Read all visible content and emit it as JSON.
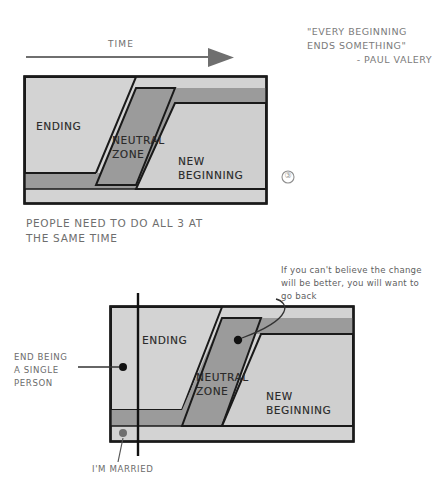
{
  "page": {
    "background": "#ffffff",
    "width": 446,
    "height": 489
  },
  "colors": {
    "ending_fill": "#d3d3d3",
    "neutral_fill": "#9b9b9b",
    "new_beginning_fill": "#cfcfcf",
    "band_fill": "#9b9b9b",
    "outline": "#1a1a1a",
    "arrow": "#6f6f6f",
    "text": "#6a6a6a",
    "label_text": "#2a2a2a",
    "leader_line": "#333333",
    "dot": "#111111"
  },
  "top_section": {
    "time_axis": {
      "label": "TIME",
      "icon": "arrow-right-icon"
    },
    "quote": {
      "line1": "\"EVERY BEGINNING",
      "line2": "ENDS SOMETHING\"",
      "attribution": "- PAUL VALERY"
    },
    "diagram": {
      "zones": [
        {
          "key": "ending",
          "label": "ENDING"
        },
        {
          "key": "neutral_zone",
          "label_line1": "NEUTRAL",
          "label_line2": "ZONE"
        },
        {
          "key": "new_beginning",
          "label_line1": "NEW",
          "label_line2": "BEGINNING"
        }
      ]
    },
    "page_mark": "③",
    "caption": {
      "line1": "PEOPLE NEED TO DO ALL 3 AT",
      "line2": "THE SAME TIME"
    }
  },
  "bottom_section": {
    "diagram": {
      "zones": [
        {
          "key": "ending",
          "label": "ENDING"
        },
        {
          "key": "neutral_zone",
          "label_line1": "NEUTRAL",
          "label_line2": "ZONE"
        },
        {
          "key": "new_beginning",
          "label_line1": "NEW",
          "label_line2": "BEGINNING"
        }
      ]
    },
    "annotations": [
      {
        "key": "go-back-note",
        "line1": "If you can't believe the change",
        "line2": "will be better, you will want to",
        "line3": "go back"
      },
      {
        "key": "end-being-single",
        "line1": "END BEING",
        "line2": "A SINGLE",
        "line3": "PERSON"
      },
      {
        "key": "im-married",
        "line1": "I'M MARRIED"
      }
    ]
  }
}
